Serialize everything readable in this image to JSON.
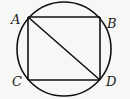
{
  "diagram": {
    "type": "geometry",
    "stroke_color": "#111111",
    "circle": {
      "cx": 64,
      "cy": 49,
      "r": 47
    },
    "points": {
      "A": {
        "label": "A",
        "x": 28,
        "y": 17
      },
      "B": {
        "label": "B",
        "x": 100,
        "y": 17
      },
      "C": {
        "label": "C",
        "x": 28,
        "y": 80
      },
      "D": {
        "label": "D",
        "x": 100,
        "y": 80
      }
    },
    "segments": [
      "AB",
      "BD",
      "DC",
      "CA",
      "AD"
    ],
    "labels": {
      "A": "A",
      "B": "B",
      "C": "C",
      "D": "D"
    }
  }
}
